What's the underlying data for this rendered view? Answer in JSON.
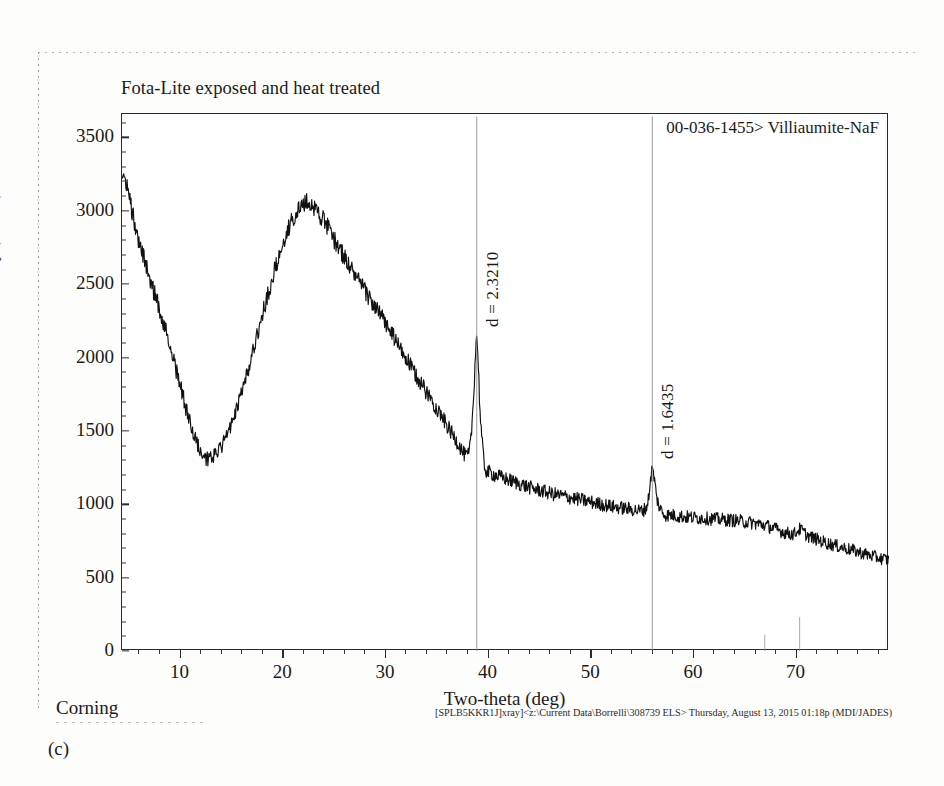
{
  "page": {
    "figure_caption": "(c)",
    "corning_label": "Corning",
    "footer_path": "[SPLB5KKR1J]xray]<z:\\Current Data\\Borrelli\\308739 ELS> Thursday, August 13, 2015 01:18p (MDI/JADES)"
  },
  "chart_data": {
    "type": "line",
    "title": "Fota-Lite exposed and heat treated",
    "xlabel": "Two-theta (deg)",
    "ylabel": "Intensity (counts)",
    "xlim": [
      4.3,
      79.0
    ],
    "ylim": [
      0,
      3660
    ],
    "grid": false,
    "legend_position": "top-right",
    "legend_entries": [
      "00-036-1455> Villiaumite-NaF"
    ],
    "y_ticks": [
      0,
      500,
      1000,
      1500,
      2000,
      2500,
      3000,
      3500
    ],
    "y_tick_labels": [
      "0",
      "500",
      "1000",
      "1500",
      "2000",
      "2500",
      "3000",
      "3500"
    ],
    "x_ticks": [
      10,
      20,
      30,
      40,
      50,
      60,
      70
    ],
    "x_tick_labels": [
      "10",
      "20",
      "30",
      "40",
      "50",
      "60",
      "70"
    ],
    "x_minor_tick_step": 2,
    "y_minor_tick_step": 100,
    "line_color": "#111111",
    "noise_amplitude_counts": 42,
    "annotations": [
      {
        "text": "d = 2.3210",
        "two_theta": 38.85,
        "intensity": 2130,
        "orientation": "vertical"
      },
      {
        "text": "d = 1.6435",
        "two_theta": 55.95,
        "intensity": 1235,
        "orientation": "vertical"
      }
    ],
    "reference_sticks": [
      {
        "two_theta": 38.85,
        "relative_height": 1.0
      },
      {
        "two_theta": 55.95,
        "relative_height": 1.0
      },
      {
        "two_theta": 66.9,
        "relative_height": 0.055
      },
      {
        "two_theta": 70.3,
        "relative_height": 0.19
      }
    ],
    "series": [
      {
        "name": "Fota-Lite exposed and heat treated",
        "x": [
          4.3,
          5.0,
          6.0,
          7.0,
          8.0,
          9.0,
          10.0,
          11.0,
          12.0,
          12.6,
          13.5,
          14.5,
          15.5,
          16.5,
          17.5,
          18.5,
          19.5,
          20.5,
          21.5,
          22.4,
          23.2,
          24.0,
          25.0,
          26.0,
          27.0,
          28.0,
          29.0,
          30.0,
          31.0,
          32.0,
          33.0,
          34.0,
          35.0,
          36.0,
          37.0,
          37.8,
          38.2,
          38.5,
          38.85,
          39.2,
          39.6,
          40.2,
          41.0,
          42.0,
          43.0,
          44.0,
          45.0,
          46.0,
          47.0,
          48.0,
          49.0,
          50.0,
          51.0,
          52.0,
          53.0,
          54.0,
          55.0,
          55.5,
          55.95,
          56.4,
          57.0,
          58.0,
          59.0,
          60.0,
          61.0,
          62.0,
          63.0,
          64.0,
          65.0,
          66.0,
          67.0,
          68.0,
          69.0,
          69.8,
          70.3,
          71.0,
          72.0,
          73.0,
          74.0,
          75.0,
          76.0,
          77.0,
          78.0,
          79.0
        ],
        "y": [
          3300,
          3090,
          2780,
          2540,
          2320,
          2070,
          1800,
          1540,
          1360,
          1310,
          1345,
          1470,
          1660,
          1900,
          2160,
          2430,
          2680,
          2880,
          3010,
          3055,
          3010,
          2930,
          2800,
          2680,
          2560,
          2450,
          2340,
          2230,
          2110,
          1990,
          1870,
          1760,
          1650,
          1530,
          1420,
          1330,
          1390,
          1680,
          2130,
          1600,
          1270,
          1215,
          1190,
          1165,
          1140,
          1115,
          1095,
          1075,
          1060,
          1045,
          1030,
          1015,
          1000,
          985,
          975,
          965,
          960,
          1010,
          1235,
          1040,
          940,
          925,
          915,
          910,
          905,
          900,
          895,
          890,
          880,
          870,
          855,
          830,
          805,
          800,
          830,
          790,
          760,
          735,
          715,
          695,
          675,
          655,
          635,
          620
        ]
      }
    ]
  }
}
